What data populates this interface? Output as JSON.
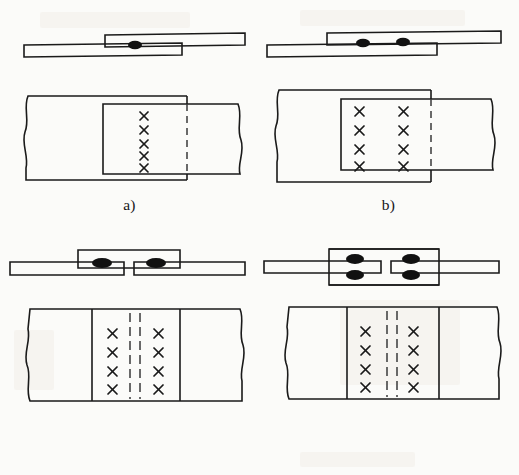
{
  "figure": {
    "background_color": "#fbfbf9",
    "ink_color": "#1a1a1a",
    "panel_count": 4
  },
  "panels": [
    {
      "id": "a",
      "caption": "a)",
      "joint_type": "single-lap joint, single bolt row",
      "elevation": {
        "description": "Two flat plates overlapping; upper plate enters from the right, lower plate from the left",
        "plate_count": 2,
        "cover_plates": 0,
        "fastener_heads_visible": 1,
        "fastener_rows_in_section": 1,
        "gap_between_plates": false
      },
      "plan": {
        "fastener_columns": 1,
        "fastener_rows": 5,
        "fastener_total": 5,
        "fastener_symbol": "×",
        "dashed_lines": 1,
        "dashed_line_meaning": "hidden edge of underlying plate",
        "break_lines": 2,
        "overlap_rectangles": 2
      }
    },
    {
      "id": "b",
      "caption": "b)",
      "joint_type": "single-lap joint, two bolt rows",
      "elevation": {
        "description": "Two flat plates overlapping with two fasteners through the lap",
        "plate_count": 2,
        "cover_plates": 0,
        "fastener_heads_visible": 2,
        "fastener_rows_in_section": 1,
        "gap_between_plates": false
      },
      "plan": {
        "fastener_columns": 2,
        "fastener_rows": 4,
        "fastener_total": 8,
        "fastener_symbol": "×",
        "dashed_lines": 1,
        "dashed_line_meaning": "hidden edge of underlying plate",
        "break_lines": 2,
        "overlap_rectangles": 2
      }
    },
    {
      "id": "c",
      "caption": "c)",
      "joint_type": "butt joint with single cover plate",
      "elevation": {
        "description": "Two co-planar plates butted with a small gap, joined by one cover plate above",
        "plate_count": 2,
        "cover_plates": 1,
        "cover_plate_position": "top",
        "fastener_heads_visible": 2,
        "fastener_rows_in_section": 1,
        "gap_between_plates": true
      },
      "plan": {
        "fastener_columns": 2,
        "fastener_rows": 4,
        "fastener_total": 8,
        "fastener_symbol": "×",
        "dashed_lines": 2,
        "dashed_line_meaning": "butt gap between the two main plates",
        "break_lines": 2,
        "overlap_rectangles": 1
      }
    },
    {
      "id": "d",
      "caption": "d)",
      "joint_type": "butt joint with double cover plates",
      "elevation": {
        "description": "Two co-planar plates butted with a small gap, sandwiched by cover plates above and below",
        "plate_count": 2,
        "cover_plates": 2,
        "cover_plate_position": "top and bottom",
        "fastener_heads_visible": 4,
        "fastener_rows_in_section": 2,
        "gap_between_plates": true
      },
      "plan": {
        "fastener_columns": 2,
        "fastener_rows": 4,
        "fastener_total": 8,
        "fastener_symbol": "×",
        "dashed_lines": 2,
        "dashed_line_meaning": "butt gap between the two main plates",
        "break_lines": 2,
        "overlap_rectangles": 1
      }
    }
  ]
}
